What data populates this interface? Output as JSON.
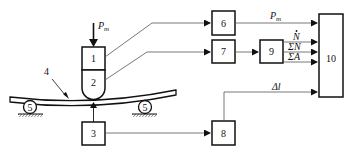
{
  "diagram": {
    "type": "block-diagram",
    "colors": {
      "stroke": "#111111",
      "line": "#555555",
      "background": "#ffffff"
    },
    "blocks": [
      {
        "id": "1",
        "label": "1"
      },
      {
        "id": "2",
        "label": "2"
      },
      {
        "id": "3",
        "label": "3"
      },
      {
        "id": "4",
        "label": "4"
      },
      {
        "id": "5a",
        "label": "5"
      },
      {
        "id": "5b",
        "label": "5"
      },
      {
        "id": "6",
        "label": "6"
      },
      {
        "id": "7",
        "label": "7"
      },
      {
        "id": "8",
        "label": "8"
      },
      {
        "id": "9",
        "label": "9"
      },
      {
        "id": "10",
        "label": "10"
      }
    ],
    "signals": {
      "load_in": {
        "main": "P",
        "sub": "m"
      },
      "p_out": {
        "main": "P",
        "sub": "m"
      },
      "n_dot": "N",
      "sum_n": "ΣN",
      "sum_a": "ΣA",
      "delta_l": "Δl"
    }
  }
}
